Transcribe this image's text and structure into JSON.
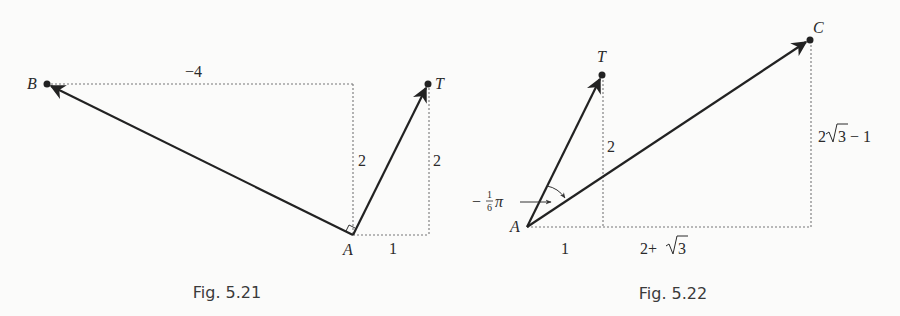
{
  "figures": [
    {
      "caption": "Fig. 5.21",
      "points": {
        "A": {
          "label": "A",
          "x": 353,
          "y": 235
        },
        "B": {
          "label": "B",
          "x": 47,
          "y": 84
        },
        "T": {
          "label": "T",
          "x": 428,
          "y": 84
        }
      },
      "vectors": [
        "A→B",
        "A→T"
      ],
      "dimension_labels": {
        "top_horizontal": "−4",
        "left_vertical": "2",
        "right_vertical": "2",
        "bottom_horizontal": "1"
      },
      "right_angle_at": "A"
    },
    {
      "caption": "Fig. 5.22",
      "points": {
        "A": {
          "label": "A",
          "x": 527,
          "y": 227
        },
        "T": {
          "label": "T",
          "x": 602,
          "y": 75
        },
        "C": {
          "label": "C",
          "x": 810,
          "y": 40
        }
      },
      "vectors": [
        "A→T",
        "A→C"
      ],
      "dimension_labels": {
        "mid_vertical": "2",
        "right_vertical_prefix": "2",
        "right_vertical_radicand": "3",
        "right_vertical_suffix": " − 1",
        "bottom_left": "1",
        "bottom_right_prefix": "2+",
        "bottom_right_radicand": "3"
      },
      "angle_label": {
        "sign": "−",
        "numerator": "1",
        "denominator": "6",
        "symbol": "π"
      }
    }
  ]
}
